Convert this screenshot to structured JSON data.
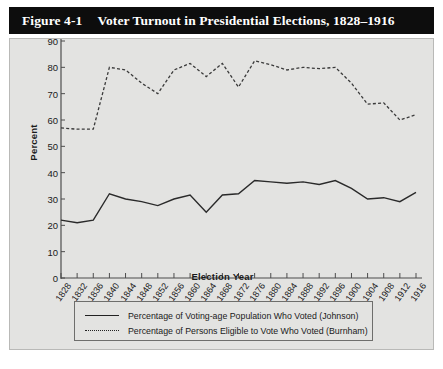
{
  "figure": {
    "number": "Figure 4-1",
    "title": "Voter Turnout in Presidential Elections, 1828–1916"
  },
  "chart_data": {
    "type": "line",
    "title": "Voter Turnout in Presidential Elections, 1828–1916",
    "xlabel": "Election Year",
    "ylabel": "Percent",
    "ylim": [
      0,
      90
    ],
    "yticks": [
      0,
      10,
      20,
      30,
      40,
      50,
      60,
      70,
      80,
      90
    ],
    "grid": false,
    "legend_position": "bottom",
    "categories": [
      "1828",
      "1832",
      "1836",
      "1840",
      "1844",
      "1848",
      "1852",
      "1856",
      "1860",
      "1864",
      "1868",
      "1872",
      "1876",
      "1880",
      "1884",
      "1888",
      "1892",
      "1896",
      "1900",
      "1904",
      "1908",
      "1912",
      "1916"
    ],
    "series": [
      {
        "name": "Percentage of Voting-age Population Who Voted (Johnson)",
        "style": "solid",
        "values": [
          22,
          21,
          22,
          32,
          30,
          29,
          27.5,
          30,
          31.5,
          25,
          31.5,
          32,
          37,
          36.5,
          36,
          36.5,
          35.5,
          37,
          34,
          30,
          30.5,
          29,
          32.5
        ]
      },
      {
        "name": "Percentage of Persons Eligible to Vote Who Voted (Burnham)",
        "style": "dotted",
        "values": [
          57,
          56.5,
          56.5,
          80,
          79,
          74,
          70,
          79,
          81.5,
          76.5,
          81.5,
          72.5,
          82.5,
          81,
          79,
          80,
          79.5,
          80,
          74,
          66,
          66.5,
          60,
          62
        ]
      }
    ]
  },
  "legend": {
    "items": [
      {
        "label": "Percentage of Voting-age Population Who Voted (Johnson)",
        "style": "solid"
      },
      {
        "label": "Percentage of Persons Eligible to Vote Who Voted (Burnham)",
        "style": "dotted"
      }
    ]
  },
  "colors": {
    "title_bar": "#0d0d0d",
    "panel_bg": "#e3e3e1",
    "line": "#222222",
    "text": "#1a1a1a"
  }
}
